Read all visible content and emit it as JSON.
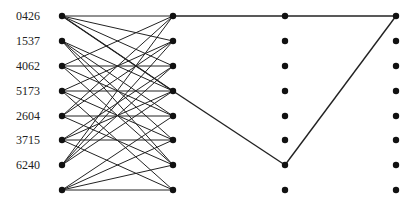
{
  "diagram": {
    "row_labels": [
      "0426",
      "1537",
      "4062",
      "5173",
      "2604",
      "3715",
      "6240"
    ],
    "columns": 4,
    "rows": 8,
    "node_color": "#111111",
    "edge_color": "#222222",
    "bipartite_edges": [
      [
        0,
        0
      ],
      [
        0,
        1
      ],
      [
        0,
        2
      ],
      [
        0,
        3
      ],
      [
        1,
        3
      ],
      [
        1,
        4
      ],
      [
        1,
        5
      ],
      [
        1,
        6
      ],
      [
        2,
        0
      ],
      [
        2,
        2
      ],
      [
        2,
        4
      ],
      [
        2,
        6
      ],
      [
        3,
        1
      ],
      [
        3,
        3
      ],
      [
        3,
        5
      ],
      [
        3,
        7
      ],
      [
        4,
        0
      ],
      [
        4,
        1
      ],
      [
        4,
        4
      ],
      [
        4,
        6
      ],
      [
        5,
        2
      ],
      [
        5,
        3
      ],
      [
        5,
        5
      ],
      [
        5,
        7
      ],
      [
        6,
        0
      ],
      [
        6,
        1
      ],
      [
        6,
        2
      ],
      [
        6,
        3
      ],
      [
        7,
        4
      ],
      [
        7,
        5
      ],
      [
        7,
        6
      ],
      [
        7,
        7
      ]
    ],
    "path_edges": [
      [
        [
          1,
          0
        ],
        [
          2,
          0
        ]
      ],
      [
        [
          2,
          0
        ],
        [
          3,
          0
        ]
      ],
      [
        [
          1,
          3
        ],
        [
          2,
          6
        ]
      ],
      [
        [
          2,
          6
        ],
        [
          3,
          0
        ]
      ]
    ]
  }
}
